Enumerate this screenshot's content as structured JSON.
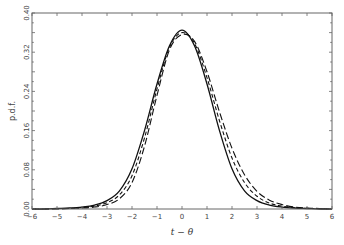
{
  "chart_data": {
    "type": "line",
    "title": "",
    "xlabel": "t − θ",
    "ylabel": "p.d.f.",
    "xlim": [
      -6,
      6
    ],
    "ylim": [
      0,
      0.4
    ],
    "grid": false,
    "legend": null,
    "xticks": [
      -6,
      -5,
      -4,
      -3,
      -2,
      -1,
      0,
      1,
      2,
      3,
      4,
      5,
      6
    ],
    "yticks": [
      0.0,
      0.08,
      0.16,
      0.24,
      0.32,
      0.4
    ],
    "ytick_labels": [
      "0.00",
      "0.08",
      "0.16",
      "0.24",
      "0.32",
      "0.40"
    ],
    "x": [
      -6,
      -5.5,
      -5,
      -4.5,
      -4,
      -3.5,
      -3,
      -2.5,
      -2,
      -1.5,
      -1,
      -0.5,
      0,
      0.5,
      1,
      1.5,
      2,
      2.5,
      3,
      3.5,
      4,
      4.5,
      5,
      5.5,
      6
    ],
    "series": [
      {
        "name": "solid",
        "style": "solid",
        "values": [
          0.0,
          0.0,
          0.001,
          0.002,
          0.004,
          0.008,
          0.017,
          0.037,
          0.082,
          0.16,
          0.255,
          0.333,
          0.365,
          0.333,
          0.255,
          0.16,
          0.082,
          0.037,
          0.017,
          0.008,
          0.004,
          0.002,
          0.001,
          0.0,
          0.0
        ]
      },
      {
        "name": "short-dash",
        "style": "dashed",
        "values": [
          0.0,
          0.0,
          0.001,
          0.001,
          0.003,
          0.006,
          0.013,
          0.029,
          0.068,
          0.145,
          0.245,
          0.33,
          0.36,
          0.338,
          0.268,
          0.18,
          0.104,
          0.054,
          0.026,
          0.012,
          0.006,
          0.003,
          0.001,
          0.001,
          0.0
        ]
      },
      {
        "name": "long-dash",
        "style": "long-dashed",
        "values": [
          0.0,
          0.0,
          0.0,
          0.001,
          0.002,
          0.004,
          0.009,
          0.021,
          0.054,
          0.128,
          0.232,
          0.325,
          0.356,
          0.342,
          0.28,
          0.198,
          0.124,
          0.07,
          0.036,
          0.018,
          0.009,
          0.004,
          0.002,
          0.001,
          0.0
        ]
      }
    ]
  },
  "axes": {
    "xlabel": "t − θ",
    "ylabel": "p.d.f."
  }
}
